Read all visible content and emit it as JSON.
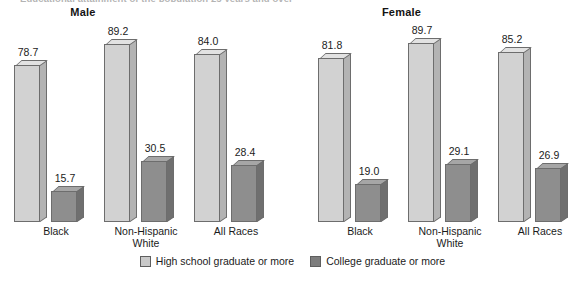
{
  "figure": {
    "clipped_top_title": "Educational attainment of the population 25 years and over",
    "legend": [
      {
        "key": "hs",
        "label": "High school graduate or more",
        "color": "#c9c9c9"
      },
      {
        "key": "col",
        "label": "College graduate or more",
        "color": "#7d7d7d"
      }
    ]
  },
  "panels": [
    {
      "title": "Male",
      "groups": [
        {
          "label_line1": "Black",
          "label_line2": "",
          "hs": "78.7",
          "col": "15.7"
        },
        {
          "label_line1": "Non-Hispanic",
          "label_line2": "White",
          "hs": "89.2",
          "col": "30.5"
        },
        {
          "label_line1": "All Races",
          "label_line2": "",
          "hs": "84.0",
          "col": "28.4"
        }
      ]
    },
    {
      "title": "Female",
      "groups": [
        {
          "label_line1": "Black",
          "label_line2": "",
          "hs": "81.8",
          "col": "19.0"
        },
        {
          "label_line1": "Non-Hispanic",
          "label_line2": "White",
          "hs": "89.7",
          "col": "29.1"
        },
        {
          "label_line1": "All Races",
          "label_line2": "",
          "hs": "85.2",
          "col": "26.9"
        }
      ]
    }
  ],
  "chart_data": {
    "type": "bar",
    "title": "Educational attainment of the population 25 years and over",
    "xlabel": "",
    "ylabel": "Percent",
    "ylim": [
      0,
      100
    ],
    "grid": false,
    "legend_position": "bottom-center",
    "panels": [
      "Male",
      "Female"
    ],
    "categories": [
      "Black",
      "Non-Hispanic White",
      "All Races"
    ],
    "series": [
      {
        "name": "High school graduate or more",
        "panel": "Male",
        "values": [
          78.7,
          89.2,
          84.0
        ],
        "color": "#c9c9c9"
      },
      {
        "name": "College graduate or more",
        "panel": "Male",
        "values": [
          15.7,
          30.5,
          28.4
        ],
        "color": "#7d7d7d"
      },
      {
        "name": "High school graduate or more",
        "panel": "Female",
        "values": [
          81.8,
          89.7,
          85.2
        ],
        "color": "#c9c9c9"
      },
      {
        "name": "College graduate or more",
        "panel": "Female",
        "values": [
          19.0,
          29.1,
          26.9
        ],
        "color": "#7d7d7d"
      }
    ]
  }
}
